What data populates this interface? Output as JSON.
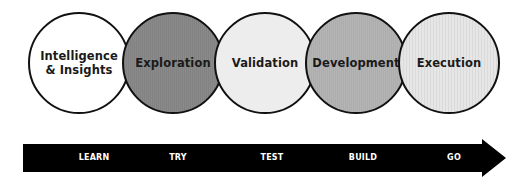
{
  "diagram": {
    "phases": [
      {
        "label": "Intelligence\n& Insights",
        "fill": "#ffffff"
      },
      {
        "label": "Exploration",
        "fill": "#8a8a8a"
      },
      {
        "label": "Validation",
        "fill": "#ededed"
      },
      {
        "label": "Development",
        "fill": "#b4b4b4"
      },
      {
        "label": "Execution",
        "fill": "#e6e6e6"
      }
    ],
    "arrow": {
      "color": "#000000",
      "stages": [
        "LEARN",
        "TRY",
        "TEST",
        "BUILD",
        "GO"
      ]
    },
    "outline_color": "#111111"
  }
}
